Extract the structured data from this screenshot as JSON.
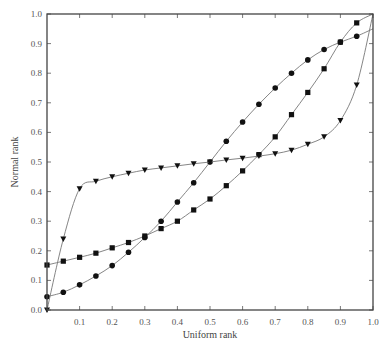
{
  "chart_data": {
    "type": "line",
    "title": "",
    "xlabel": "Uniform rank",
    "ylabel": "Normal rank",
    "xlim": [
      0.0,
      1.0
    ],
    "ylim": [
      0.0,
      1.0
    ],
    "grid": false,
    "legend": null,
    "x_ticks": [
      "0.1",
      "0.2",
      "0.3",
      "0.4",
      "0.5",
      "0.6",
      "0.7",
      "0.8",
      "0.9",
      "1.0"
    ],
    "y_ticks": [
      "0.0",
      "0.1",
      "0.2",
      "0.3",
      "0.4",
      "0.5",
      "0.6",
      "0.7",
      "0.8",
      "0.9",
      "1.0"
    ],
    "x": [
      0.0,
      0.05,
      0.1,
      0.15,
      0.2,
      0.25,
      0.3,
      0.35,
      0.4,
      0.45,
      0.5,
      0.55,
      0.6,
      0.65,
      0.7,
      0.75,
      0.8,
      0.85,
      0.9,
      0.95
    ],
    "series": [
      {
        "name": "circles",
        "marker": "circle",
        "values": [
          0.045,
          0.06,
          0.085,
          0.115,
          0.15,
          0.195,
          0.245,
          0.3,
          0.365,
          0.43,
          0.5,
          0.57,
          0.635,
          0.695,
          0.75,
          0.8,
          0.845,
          0.88,
          0.905,
          0.925
        ],
        "end": [
          1.0,
          0.95
        ]
      },
      {
        "name": "squares",
        "marker": "square",
        "values": [
          0.152,
          0.165,
          0.178,
          0.192,
          0.21,
          0.228,
          0.25,
          0.275,
          0.3,
          0.338,
          0.375,
          0.42,
          0.47,
          0.525,
          0.585,
          0.66,
          0.735,
          0.815,
          0.905,
          0.97
        ],
        "end": [
          1.0,
          1.0
        ]
      },
      {
        "name": "triangles",
        "marker": "triangle-down",
        "values": [
          0.0,
          0.24,
          0.41,
          0.435,
          0.45,
          0.462,
          0.473,
          0.48,
          0.487,
          0.494,
          0.5,
          0.507,
          0.513,
          0.52,
          0.528,
          0.54,
          0.56,
          0.585,
          0.64,
          0.76
        ],
        "end": [
          1.0,
          1.0
        ]
      }
    ]
  }
}
